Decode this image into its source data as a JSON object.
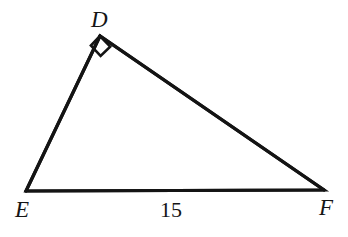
{
  "figure": {
    "kind": "right-triangle-diagram",
    "background_color": "#ffffff",
    "stroke_color": "#141414",
    "text_color": "#151515",
    "stroke_width": 3.2,
    "canvas": {
      "width": 348,
      "height": 237
    },
    "vertices": [
      {
        "id": "D",
        "label": "D",
        "x": 100,
        "y": 36,
        "label_x": 91,
        "label_y": 8,
        "right_angle": true
      },
      {
        "id": "E",
        "label": "E",
        "x": 26,
        "y": 191,
        "label_x": 15,
        "label_y": 198,
        "right_angle": false
      },
      {
        "id": "F",
        "label": "F",
        "x": 324,
        "y": 190,
        "label_x": 319,
        "label_y": 196,
        "right_angle": false
      }
    ],
    "edges": [
      {
        "id": "DE",
        "from": "D",
        "to": "E"
      },
      {
        "id": "DF",
        "from": "D",
        "to": "F"
      },
      {
        "id": "EF",
        "from": "E",
        "to": "F"
      }
    ],
    "edge_labels": [
      {
        "id": "EF-length",
        "edge": "EF",
        "text": "15",
        "x": 160,
        "y": 199
      }
    ],
    "right_angle_marker": {
      "at_vertex": "D",
      "size": 15,
      "points": "100,36 110.2,46.6 100.6,56.0 90.9,45.6"
    },
    "polygon_points": "100,36 26,191 324,190"
  }
}
